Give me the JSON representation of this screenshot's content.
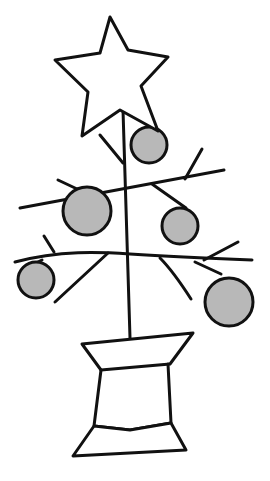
{
  "drawing": {
    "subject": "Christmas tree sketch",
    "stroke_color": "#111111",
    "ornament_fill": "#b8b8b8",
    "background": "#ffffff"
  },
  "star": {
    "points": "110,17 128,50 168,57 141,86 158,131 120,110 82,136 88,92 55,60 100,53"
  },
  "trunk": {
    "x1": 123,
    "y1": 110,
    "x2": 130,
    "y2": 338
  },
  "branches": [
    {
      "d": "M20,208 L224,170"
    },
    {
      "d": "M185,179 L202,149"
    },
    {
      "d": "M58,180 L92,196"
    },
    {
      "d": "M100,135 L123,163"
    },
    {
      "d": "M152,184 L186,208"
    },
    {
      "d": "M15,262 C60,250 100,252 130,254 C160,256 200,258 252,260"
    },
    {
      "d": "M44,236 L54,252"
    },
    {
      "d": "M26,268 L42,260"
    },
    {
      "d": "M55,302 L108,253"
    },
    {
      "d": "M160,258 C172,270 182,285 191,299"
    },
    {
      "d": "M204,260 L238,242"
    },
    {
      "d": "M195,262 L221,274"
    }
  ],
  "ornaments": [
    {
      "cx": 149,
      "cy": 145,
      "r": 18
    },
    {
      "cx": 87,
      "cy": 211,
      "r": 24
    },
    {
      "cx": 180,
      "cy": 226,
      "r": 18
    },
    {
      "cx": 36,
      "cy": 280,
      "r": 18
    },
    {
      "cx": 229,
      "cy": 302,
      "r": 24
    }
  ],
  "pot": [
    {
      "points": "82,344 193,333 170,364 101,370"
    },
    {
      "d": "M101,370 L94,426 L130,430 L171,423 L168,364"
    },
    {
      "points": "94,426 130,430 171,423 186,450 73,456"
    }
  ]
}
